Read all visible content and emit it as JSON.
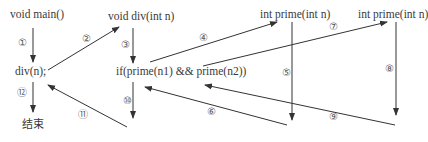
{
  "nodes": {
    "main": "void main()",
    "div_call": "div(n);",
    "end": "结束",
    "div_def": "void div(int n)",
    "if_stmt": "if(prime(n1) && prime(n2))",
    "prime1": "int prime(int n)",
    "prime2": "int prime(int n)"
  },
  "steps": {
    "s1": "①",
    "s2": "②",
    "s3": "③",
    "s4": "④",
    "s5": "⑤",
    "s6": "⑥",
    "s7": "⑦",
    "s8": "⑧",
    "s9": "⑨",
    "s10": "⑩",
    "s11": "⑪",
    "s12": "⑫"
  },
  "colors": {
    "line": "#333333",
    "text": "#3a3a3a"
  }
}
